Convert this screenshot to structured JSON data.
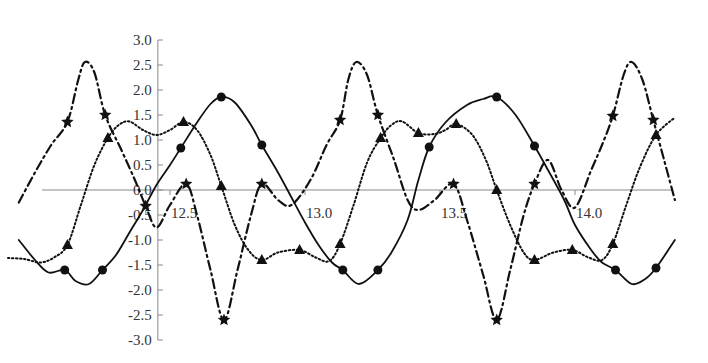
{
  "chart_data": {
    "type": "line",
    "title": "",
    "xlabel": "",
    "ylabel": "",
    "xlim": [
      11.9,
      14.4
    ],
    "ylim": [
      -3.0,
      3.0
    ],
    "grid": false,
    "legend": null,
    "x_ticks": [
      {
        "value": 12.5,
        "label": "12.5"
      },
      {
        "value": 13.0,
        "label": "13.0"
      },
      {
        "value": 13.5,
        "label": "13.5"
      },
      {
        "value": 14.0,
        "label": "14.0"
      }
    ],
    "y_ticks": [
      {
        "value": 3.0,
        "label": "3.0"
      },
      {
        "value": 2.5,
        "label": "2.5"
      },
      {
        "value": 2.0,
        "label": "2.0"
      },
      {
        "value": 1.5,
        "label": "1.5"
      },
      {
        "value": 1.0,
        "label": "1.0"
      },
      {
        "value": 0.5,
        "label": "0.5"
      },
      {
        "value": 0.0,
        "label": "0.0"
      },
      {
        "value": -0.5,
        "label": "-0.5"
      },
      {
        "value": -1.0,
        "label": "-1.0"
      },
      {
        "value": -1.5,
        "label": "-1.5"
      },
      {
        "value": -2.0,
        "label": "-2.0"
      },
      {
        "value": -2.5,
        "label": "-2.5"
      },
      {
        "value": -3.0,
        "label": "-3.0"
      }
    ],
    "series": [
      {
        "name": "solid-circles",
        "line_style": "solid",
        "marker": "circle",
        "color": "#111111",
        "line": [
          [
            11.94,
            -1.0
          ],
          [
            12.0,
            -1.4
          ],
          [
            12.05,
            -1.65
          ],
          [
            12.11,
            -1.6
          ],
          [
            12.15,
            -1.82
          ],
          [
            12.2,
            -1.88
          ],
          [
            12.25,
            -1.6
          ],
          [
            12.3,
            -1.3
          ],
          [
            12.35,
            -0.85
          ],
          [
            12.4,
            -0.4
          ],
          [
            12.45,
            0.1
          ],
          [
            12.5,
            0.5
          ],
          [
            12.54,
            0.84
          ],
          [
            12.6,
            1.35
          ],
          [
            12.65,
            1.72
          ],
          [
            12.69,
            1.86
          ],
          [
            12.74,
            1.75
          ],
          [
            12.8,
            1.3
          ],
          [
            12.84,
            0.9
          ],
          [
            12.9,
            0.35
          ],
          [
            12.95,
            -0.15
          ],
          [
            13.0,
            -0.65
          ],
          [
            13.05,
            -1.1
          ],
          [
            13.1,
            -1.45
          ],
          [
            13.14,
            -1.6
          ],
          [
            13.2,
            -1.88
          ],
          [
            13.27,
            -1.6
          ],
          [
            13.32,
            -1.25
          ],
          [
            13.38,
            -0.6
          ],
          [
            13.42,
            0.2
          ],
          [
            13.46,
            0.86
          ],
          [
            13.52,
            1.35
          ],
          [
            13.6,
            1.7
          ],
          [
            13.66,
            1.82
          ],
          [
            13.71,
            1.86
          ],
          [
            13.78,
            1.5
          ],
          [
            13.85,
            0.88
          ],
          [
            13.9,
            0.4
          ],
          [
            13.96,
            -0.2
          ],
          [
            14.0,
            -0.7
          ],
          [
            14.06,
            -1.2
          ],
          [
            14.1,
            -1.45
          ],
          [
            14.15,
            -1.6
          ],
          [
            14.21,
            -1.88
          ],
          [
            14.26,
            -1.78
          ],
          [
            14.3,
            -1.56
          ],
          [
            14.37,
            -1.0
          ]
        ],
        "markers": [
          [
            12.11,
            -1.6
          ],
          [
            12.25,
            -1.6
          ],
          [
            12.54,
            0.84
          ],
          [
            12.69,
            1.86
          ],
          [
            12.84,
            0.9
          ],
          [
            13.14,
            -1.6
          ],
          [
            13.27,
            -1.6
          ],
          [
            13.46,
            0.86
          ],
          [
            13.71,
            1.86
          ],
          [
            13.85,
            0.88
          ],
          [
            14.15,
            -1.6
          ],
          [
            14.3,
            -1.56
          ]
        ]
      },
      {
        "name": "dashdot-stars",
        "line_style": "dashdot",
        "marker": "star",
        "color": "#111111",
        "line": [
          [
            11.94,
            -0.25
          ],
          [
            12.0,
            0.35
          ],
          [
            12.06,
            0.9
          ],
          [
            12.12,
            1.36
          ],
          [
            12.16,
            2.2
          ],
          [
            12.185,
            2.56
          ],
          [
            12.22,
            2.35
          ],
          [
            12.26,
            1.5
          ],
          [
            12.32,
            0.8
          ],
          [
            12.37,
            0.2
          ],
          [
            12.41,
            -0.32
          ],
          [
            12.45,
            -0.75
          ],
          [
            12.5,
            -0.3
          ],
          [
            12.56,
            0.12
          ],
          [
            12.6,
            -0.5
          ],
          [
            12.65,
            -1.6
          ],
          [
            12.7,
            -2.6
          ],
          [
            12.75,
            -1.6
          ],
          [
            12.8,
            -0.5
          ],
          [
            12.84,
            0.12
          ],
          [
            12.9,
            -0.2
          ],
          [
            12.95,
            -0.3
          ],
          [
            13.02,
            0.2
          ],
          [
            13.08,
            0.9
          ],
          [
            13.13,
            1.4
          ],
          [
            13.16,
            2.2
          ],
          [
            13.19,
            2.56
          ],
          [
            13.23,
            2.3
          ],
          [
            13.27,
            1.5
          ],
          [
            13.33,
            0.6
          ],
          [
            13.38,
            -0.2
          ],
          [
            13.42,
            -0.4
          ],
          [
            13.48,
            -0.2
          ],
          [
            13.55,
            0.12
          ],
          [
            13.6,
            -0.6
          ],
          [
            13.66,
            -1.7
          ],
          [
            13.71,
            -2.6
          ],
          [
            13.76,
            -1.6
          ],
          [
            13.81,
            -0.5
          ],
          [
            13.85,
            0.12
          ],
          [
            13.9,
            0.6
          ],
          [
            13.95,
            0.0
          ],
          [
            14.0,
            -0.35
          ],
          [
            14.06,
            0.4
          ],
          [
            14.1,
            0.9
          ],
          [
            14.14,
            1.48
          ],
          [
            14.18,
            2.3
          ],
          [
            14.21,
            2.56
          ],
          [
            14.25,
            2.2
          ],
          [
            14.29,
            1.4
          ],
          [
            14.33,
            0.6
          ],
          [
            14.37,
            -0.2
          ]
        ],
        "markers": [
          [
            12.12,
            1.36
          ],
          [
            12.26,
            1.5
          ],
          [
            12.41,
            -0.32
          ],
          [
            12.56,
            0.12
          ],
          [
            12.7,
            -2.6
          ],
          [
            12.84,
            0.12
          ],
          [
            13.13,
            1.4
          ],
          [
            13.27,
            1.5
          ],
          [
            13.55,
            0.12
          ],
          [
            13.71,
            -2.6
          ],
          [
            13.85,
            0.12
          ],
          [
            14.14,
            1.48
          ],
          [
            14.29,
            1.4
          ]
        ]
      },
      {
        "name": "dotted-triangles",
        "line_style": "dotted",
        "marker": "triangle",
        "color": "#111111",
        "line": [
          [
            11.9,
            -1.36
          ],
          [
            11.96,
            -1.38
          ],
          [
            12.02,
            -1.45
          ],
          [
            12.07,
            -1.35
          ],
          [
            12.12,
            -1.1
          ],
          [
            12.17,
            -0.3
          ],
          [
            12.22,
            0.5
          ],
          [
            12.27,
            1.04
          ],
          [
            12.31,
            1.3
          ],
          [
            12.35,
            1.37
          ],
          [
            12.4,
            1.2
          ],
          [
            12.45,
            1.1
          ],
          [
            12.5,
            1.2
          ],
          [
            12.55,
            1.36
          ],
          [
            12.6,
            1.2
          ],
          [
            12.65,
            0.7
          ],
          [
            12.69,
            0.08
          ],
          [
            12.74,
            -0.7
          ],
          [
            12.79,
            -1.2
          ],
          [
            12.84,
            -1.4
          ],
          [
            12.9,
            -1.25
          ],
          [
            12.98,
            -1.2
          ],
          [
            13.04,
            -1.35
          ],
          [
            13.09,
            -1.42
          ],
          [
            13.13,
            -1.08
          ],
          [
            13.18,
            -0.3
          ],
          [
            13.23,
            0.55
          ],
          [
            13.28,
            1.04
          ],
          [
            13.32,
            1.3
          ],
          [
            13.36,
            1.37
          ],
          [
            13.42,
            1.14
          ],
          [
            13.48,
            1.12
          ],
          [
            13.52,
            1.2
          ],
          [
            13.56,
            1.32
          ],
          [
            13.62,
            1.1
          ],
          [
            13.67,
            0.6
          ],
          [
            13.71,
            0.0
          ],
          [
            13.76,
            -0.7
          ],
          [
            13.81,
            -1.25
          ],
          [
            13.85,
            -1.4
          ],
          [
            13.92,
            -1.25
          ],
          [
            13.99,
            -1.2
          ],
          [
            14.05,
            -1.35
          ],
          [
            14.1,
            -1.4
          ],
          [
            14.14,
            -1.08
          ],
          [
            14.19,
            -0.3
          ],
          [
            14.24,
            0.45
          ],
          [
            14.3,
            1.1
          ],
          [
            14.37,
            1.45
          ]
        ],
        "markers": [
          [
            12.12,
            -1.1
          ],
          [
            12.27,
            1.04
          ],
          [
            12.55,
            1.36
          ],
          [
            12.69,
            0.08
          ],
          [
            12.84,
            -1.4
          ],
          [
            12.98,
            -1.2
          ],
          [
            13.13,
            -1.08
          ],
          [
            13.28,
            1.04
          ],
          [
            13.42,
            1.14
          ],
          [
            13.56,
            1.32
          ],
          [
            13.71,
            0.0
          ],
          [
            13.85,
            -1.4
          ],
          [
            13.99,
            -1.2
          ],
          [
            14.14,
            -1.08
          ],
          [
            14.3,
            1.1
          ]
        ]
      }
    ],
    "layout": {
      "x_axis_y_value": 0.0,
      "y_axis_x_value": 12.455,
      "axis_color": "#888888"
    }
  }
}
